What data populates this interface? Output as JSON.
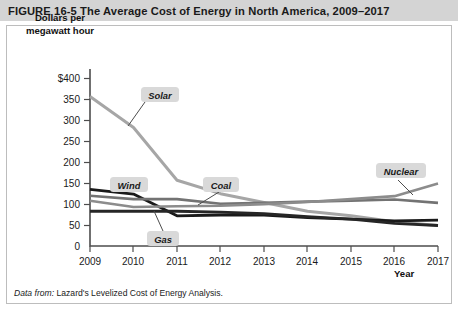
{
  "figure": {
    "label": "FIGURE",
    "number": "16-5",
    "title": "The Average Cost of Energy in North America, 2009–2017",
    "title_full": "FIGURE  16-5  The Average Cost of Energy in North America, 2009–2017",
    "source_prefix": "Data from:",
    "source_text": "Lazard's Levelized Cost of Energy Analysis.",
    "title_bar_color": "#d4d4d4"
  },
  "axes": {
    "ylabel_line1": "Dollars per",
    "ylabel_line2": "megawatt hour",
    "xlabel": "Year",
    "yticks": [
      "$400",
      "350",
      "300",
      "250",
      "200",
      "150",
      "100",
      "50",
      "0"
    ],
    "xticks": [
      "2009",
      "2010",
      "2011",
      "2012",
      "2013",
      "2014",
      "2015",
      "2016",
      "2017"
    ]
  },
  "callouts": [
    {
      "name": "solar",
      "label": "Solar"
    },
    {
      "name": "wind",
      "label": "Wind"
    },
    {
      "name": "coal",
      "label": "Coal"
    },
    {
      "name": "gas",
      "label": "Gas"
    },
    {
      "name": "nuclear",
      "label": "Nuclear"
    }
  ],
  "chart_data": {
    "type": "line",
    "title": "The Average Cost of Energy in North America, 2009–2017",
    "subtitle": "",
    "xlabel": "Year",
    "ylabel": "Dollars per megawatt hour",
    "x": [
      2009,
      2010,
      2011,
      2012,
      2013,
      2014,
      2015,
      2016,
      2017
    ],
    "categories": [
      "2009",
      "2010",
      "2011",
      "2012",
      "2013",
      "2014",
      "2015",
      "2016",
      "2017"
    ],
    "xlim": [
      2009,
      2017
    ],
    "ylim": [
      0,
      400
    ],
    "ytick_values": [
      0,
      50,
      100,
      150,
      200,
      250,
      300,
      350,
      400
    ],
    "grid": false,
    "legend": "inline-callout-labels",
    "series": [
      {
        "name": "Solar",
        "color": "#a6a6a6",
        "values": [
          357,
          283,
          157,
          125,
          104,
          83,
          72,
          58,
          49
        ]
      },
      {
        "name": "Wind",
        "color": "#1a1a1a",
        "values": [
          135,
          124,
          72,
          74,
          74,
          68,
          64,
          60,
          62
        ]
      },
      {
        "name": "Coal",
        "color": "#737373",
        "values": [
          120,
          112,
          112,
          101,
          103,
          106,
          108,
          111,
          103
        ]
      },
      {
        "name": "Gas",
        "color": "#262626",
        "values": [
          83,
          83,
          83,
          81,
          77,
          70,
          64,
          54,
          49
        ]
      },
      {
        "name": "Nuclear",
        "color": "#8c8c8c",
        "values": [
          108,
          93,
          95,
          96,
          100,
          105,
          112,
          119,
          149
        ]
      }
    ],
    "annotations": [
      {
        "text": "Solar",
        "series": "Solar"
      },
      {
        "text": "Wind",
        "series": "Wind"
      },
      {
        "text": "Coal",
        "series": "Coal"
      },
      {
        "text": "Gas",
        "series": "Gas"
      },
      {
        "text": "Nuclear",
        "series": "Nuclear"
      }
    ],
    "source": "Data from: Lazard's Levelized Cost of Energy Analysis."
  }
}
